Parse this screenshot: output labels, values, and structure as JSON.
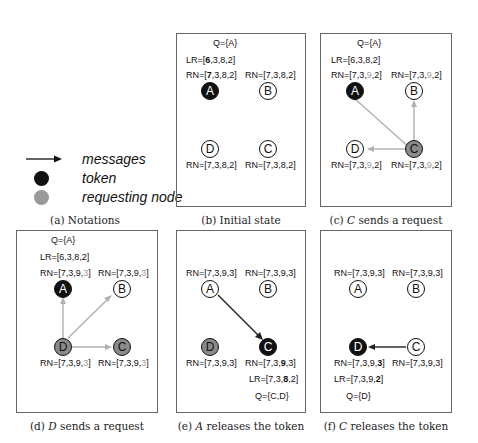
{
  "legend": {
    "caption": "(a) Notations",
    "items": [
      {
        "symbol": "arrow",
        "label": "messages"
      },
      {
        "symbol": "black-circle",
        "label": "token"
      },
      {
        "symbol": "gray-circle",
        "label": "requesting node"
      }
    ]
  },
  "colors": {
    "token": "#111111",
    "requesting": "#8a8a8a",
    "highlight": "#9a9a9a",
    "request_arrow": "#b0b0b0",
    "token_arrow": "#222222"
  },
  "panels": {
    "b": {
      "caption": "(b) Initial state",
      "q": "Q={A}",
      "lr": {
        "pre": "LR=[",
        "bold": "6",
        "post": ",3,8,2]"
      },
      "A": {
        "pre": "RN=[",
        "bold": "7",
        "post": ",3,8,2]"
      },
      "B": "RN=[7,3,8,2]",
      "D": "RN=[7,3,8,2]",
      "C": "RN=[7,3,8,2]"
    },
    "c": {
      "caption_pre": "(c) ",
      "caption_var": "C",
      "caption_post": " sends a request",
      "q": "Q={A}",
      "lr": "LR=[6,3,8,2]",
      "rn": {
        "pre": "RN=[7,3,",
        "hl": "9",
        "post": ",2]"
      }
    },
    "d": {
      "caption_pre": "(d) ",
      "caption_var": "D",
      "caption_post": " sends a request",
      "q": "Q={A}",
      "lr": "LR=[6,3,8,2]",
      "rn": {
        "pre": "RN=[7,3,9,",
        "hl": "3",
        "post": "]"
      }
    },
    "e": {
      "caption_pre": "(e) ",
      "caption_var": "A",
      "caption_post": " releases the token",
      "A": "RN=[7,3,9,3]",
      "B": "RN=[7,3,9,3]",
      "D": "RN=[7,3,9,3]",
      "C": {
        "pre": "RN=[7,3,",
        "bold": "9",
        "post": ",3]"
      },
      "lr": {
        "pre": "LR=[7,3,",
        "bold": "8",
        "post": ",2]"
      },
      "q": "Q={C,D}"
    },
    "f": {
      "caption_pre": "(f) ",
      "caption_var": "C",
      "caption_post": " releases the token",
      "A": "RN=[7,3,9,3]",
      "B": "RN=[7,3,9,3]",
      "C": "RN=[7,3,9,3]",
      "D": {
        "pre": "RN=[7,3,9,",
        "bold": "3",
        "post": "]"
      },
      "lr": {
        "pre": "LR=[7,3,9,",
        "bold": "2",
        "post": "]"
      },
      "q": "Q={D}"
    }
  },
  "nodes": {
    "A": "A",
    "B": "B",
    "C": "C",
    "D": "D"
  }
}
